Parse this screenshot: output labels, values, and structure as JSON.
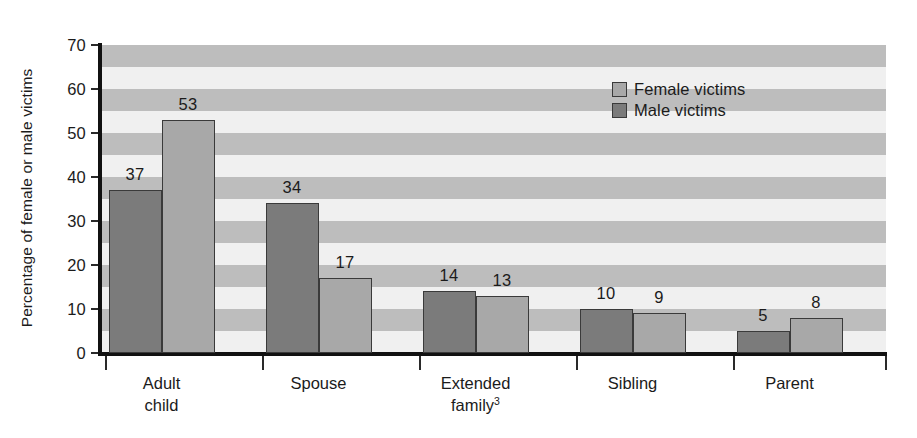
{
  "chart_data": {
    "type": "bar",
    "title": "",
    "xlabel": "",
    "ylabel": "Percentage of female or male victims",
    "categories": [
      "Adult child",
      "Spouse",
      "Extended family",
      "Sibling",
      "Parent"
    ],
    "category_lines": [
      [
        "Adult",
        "child"
      ],
      [
        "Spouse"
      ],
      [
        "Extended",
        "family"
      ],
      [
        "Sibling"
      ],
      [
        "Parent"
      ]
    ],
    "category_footnotes": [
      "",
      "",
      "3",
      "",
      ""
    ],
    "series": [
      {
        "name": "Male victims",
        "values": [
          37,
          34,
          14,
          10,
          5
        ],
        "color": "#7b7b7b"
      },
      {
        "name": "Female victims",
        "values": [
          53,
          17,
          13,
          9,
          8
        ],
        "color": "#a8a8a8"
      }
    ],
    "series_draw_order": [
      "Male victims",
      "Female victims"
    ],
    "ylim": [
      0,
      70
    ],
    "yticks": [
      0,
      10,
      20,
      30,
      40,
      50,
      60,
      70
    ],
    "ytick_labels": [
      "0",
      "10",
      "20",
      "30",
      "40",
      "50",
      "60",
      "70"
    ],
    "grid": false,
    "background_stripes": {
      "enabled": true,
      "band_size": 5,
      "light_color": "#f0f0f0",
      "dark_color": "#bdbdbd"
    },
    "legend": {
      "position": "top-right",
      "entries": [
        {
          "label": "Female victims",
          "color": "#a8a8a8"
        },
        {
          "label": "Male victims",
          "color": "#7b7b7b"
        }
      ]
    },
    "data_labels": {
      "enabled": true,
      "values": [
        [
          "37",
          "53"
        ],
        [
          "34",
          "17"
        ],
        [
          "14",
          "13"
        ],
        [
          "10",
          "9"
        ],
        [
          "5",
          "8"
        ]
      ]
    }
  }
}
